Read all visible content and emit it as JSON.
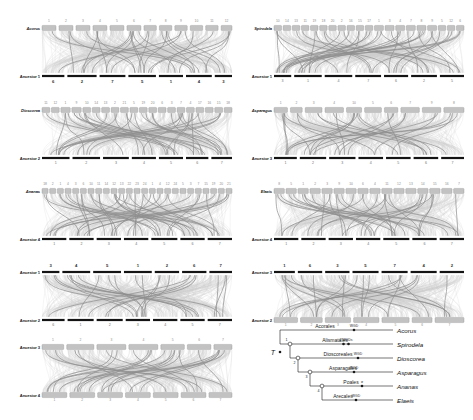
{
  "figure": {
    "type": "comparative-genomics-synteny-figure",
    "background": "#ffffff",
    "accent_dark": "#1a1a1a",
    "accent_block": "#b9b9b9",
    "ribbon_light": "#d8d8d8",
    "ribbon_mid": "#9a9a9a"
  },
  "panels": [
    {
      "id": "panel-acorus",
      "x": 8,
      "y": 14,
      "w": 228,
      "h": 78,
      "top": {
        "label": "Acorus",
        "italic": true,
        "style": "block",
        "chromosomes": [
          {
            "label": "1",
            "span": 9
          },
          {
            "label": "2",
            "span": 9
          },
          {
            "label": "3",
            "span": 9
          },
          {
            "label": "4",
            "span": 9
          },
          {
            "label": "5",
            "span": 9
          },
          {
            "label": "6",
            "span": 9
          },
          {
            "label": "7",
            "span": 8
          },
          {
            "label": "8",
            "span": 8
          },
          {
            "label": "9",
            "span": 8
          },
          {
            "label": "10",
            "span": 8
          },
          {
            "label": "11",
            "span": 8
          },
          {
            "label": "12",
            "span": 7
          }
        ]
      },
      "bottom": {
        "label": "Ancestor 1",
        "italic": false,
        "style": "bar",
        "chromosomes": [
          {
            "label": "6",
            "span": 13
          },
          {
            "label": "2",
            "span": 17
          },
          {
            "label": "7",
            "span": 15
          },
          {
            "label": "5",
            "span": 16
          },
          {
            "label": "1",
            "span": 14
          },
          {
            "label": "4",
            "span": 15
          },
          {
            "label": "3",
            "span": 10
          }
        ]
      }
    },
    {
      "id": "panel-spirodela",
      "x": 240,
      "y": 14,
      "w": 228,
      "h": 78,
      "top": {
        "label": "Spirodela",
        "italic": true,
        "style": "block",
        "chromosomes": [
          {
            "label": "10",
            "span": 5
          },
          {
            "label": "14",
            "span": 5
          },
          {
            "label": "13",
            "span": 5
          },
          {
            "label": "11",
            "span": 5
          },
          {
            "label": "19",
            "span": 5
          },
          {
            "label": "18",
            "span": 5
          },
          {
            "label": "20",
            "span": 5
          },
          {
            "label": "2",
            "span": 5
          },
          {
            "label": "16",
            "span": 5
          },
          {
            "label": "15",
            "span": 5
          },
          {
            "label": "17",
            "span": 5
          },
          {
            "label": "1",
            "span": 6
          },
          {
            "label": "3",
            "span": 6
          },
          {
            "label": "4",
            "span": 6
          },
          {
            "label": "7",
            "span": 6
          },
          {
            "label": "8",
            "span": 6
          },
          {
            "label": "9",
            "span": 6
          },
          {
            "label": "5",
            "span": 5
          },
          {
            "label": "12",
            "span": 5
          },
          {
            "label": "6",
            "span": 5
          }
        ]
      },
      "bottom": {
        "label": "Ancestor 1",
        "italic": false,
        "style": "bar",
        "chromosomes": [
          {
            "label": "3",
            "span": 10
          },
          {
            "label": "1",
            "span": 16
          },
          {
            "label": "4",
            "span": 16
          },
          {
            "label": "7",
            "span": 15
          },
          {
            "label": "6",
            "span": 14
          },
          {
            "label": "2",
            "span": 15
          },
          {
            "label": "5",
            "span": 14
          }
        ]
      }
    },
    {
      "id": "panel-dioscorea",
      "x": 8,
      "y": 96,
      "w": 228,
      "h": 78,
      "top": {
        "label": "Dioscorea",
        "italic": true,
        "style": "block",
        "chromosomes": [
          {
            "label": "11",
            "span": 5
          },
          {
            "label": "12",
            "span": 5
          },
          {
            "label": "1",
            "span": 6
          },
          {
            "label": "9",
            "span": 6
          },
          {
            "label": "10",
            "span": 5
          },
          {
            "label": "14",
            "span": 5
          },
          {
            "label": "13",
            "span": 5
          },
          {
            "label": "2",
            "span": 5
          },
          {
            "label": "21",
            "span": 5
          },
          {
            "label": "5",
            "span": 5
          },
          {
            "label": "19",
            "span": 5
          },
          {
            "label": "20",
            "span": 5
          },
          {
            "label": "6",
            "span": 5
          },
          {
            "label": "3",
            "span": 5
          },
          {
            "label": "7",
            "span": 5
          },
          {
            "label": "4",
            "span": 5
          },
          {
            "label": "17",
            "span": 5
          },
          {
            "label": "16",
            "span": 5
          },
          {
            "label": "15",
            "span": 5
          },
          {
            "label": "18",
            "span": 5
          }
        ]
      },
      "bottom": {
        "label": "Ancestor 2",
        "italic": false,
        "style": "bar",
        "chromosomes": [
          {
            "label": "1",
            "span": 16
          },
          {
            "label": "2",
            "span": 16
          },
          {
            "label": "3",
            "span": 15
          },
          {
            "label": "4",
            "span": 14
          },
          {
            "label": "5",
            "span": 14
          },
          {
            "label": "6",
            "span": 13
          },
          {
            "label": "7",
            "span": 12
          }
        ]
      }
    },
    {
      "id": "panel-asparagus",
      "x": 240,
      "y": 96,
      "w": 228,
      "h": 78,
      "top": {
        "label": "Asparagus",
        "italic": true,
        "style": "block",
        "chromosomes": [
          {
            "label": "1",
            "span": 8
          },
          {
            "label": "2",
            "span": 7
          },
          {
            "label": "3",
            "span": 10
          },
          {
            "label": "4",
            "span": 11
          },
          {
            "label": "10",
            "span": 9
          },
          {
            "label": "5",
            "span": 10
          },
          {
            "label": "6",
            "span": 8
          },
          {
            "label": "7",
            "span": 11
          },
          {
            "label": "9",
            "span": 11
          },
          {
            "label": "8",
            "span": 12
          }
        ]
      },
      "bottom": {
        "label": "Ancestor 3",
        "italic": false,
        "style": "bar",
        "chromosomes": [
          {
            "label": "1",
            "span": 13
          },
          {
            "label": "2",
            "span": 15
          },
          {
            "label": "3",
            "span": 15
          },
          {
            "label": "4",
            "span": 14
          },
          {
            "label": "5",
            "span": 14
          },
          {
            "label": "6",
            "span": 14
          },
          {
            "label": "7",
            "span": 13
          }
        ]
      }
    },
    {
      "id": "panel-ananas",
      "x": 8,
      "y": 177,
      "w": 228,
      "h": 78,
      "top": {
        "label": "Ananas",
        "italic": true,
        "style": "block",
        "chromosomes": [
          {
            "label": "18",
            "span": 4
          },
          {
            "label": "2",
            "span": 4
          },
          {
            "label": "1",
            "span": 4
          },
          {
            "label": "4",
            "span": 4
          },
          {
            "label": "3",
            "span": 4
          },
          {
            "label": "6",
            "span": 4
          },
          {
            "label": "10",
            "span": 4
          },
          {
            "label": "11",
            "span": 4
          },
          {
            "label": "14",
            "span": 4
          },
          {
            "label": "12",
            "span": 4
          },
          {
            "label": "13",
            "span": 4
          },
          {
            "label": "22",
            "span": 4
          },
          {
            "label": "23",
            "span": 4
          },
          {
            "label": "24",
            "span": 4
          },
          {
            "label": "1",
            "span": 4
          },
          {
            "label": "4",
            "span": 4
          },
          {
            "label": "12",
            "span": 4
          },
          {
            "label": "24",
            "span": 4
          },
          {
            "label": "5",
            "span": 4
          },
          {
            "label": "3",
            "span": 4
          },
          {
            "label": "7",
            "span": 4
          },
          {
            "label": "15",
            "span": 4
          },
          {
            "label": "19",
            "span": 4
          },
          {
            "label": "20",
            "span": 4
          },
          {
            "label": "21",
            "span": 4
          }
        ]
      },
      "bottom": {
        "label": "Ancestor 4",
        "italic": false,
        "style": "bar",
        "chromosomes": [
          {
            "label": "1",
            "span": 14
          },
          {
            "label": "2",
            "span": 14
          },
          {
            "label": "3",
            "span": 14
          },
          {
            "label": "4",
            "span": 14
          },
          {
            "label": "5",
            "span": 15
          },
          {
            "label": "6",
            "span": 14
          },
          {
            "label": "7",
            "span": 14
          }
        ]
      }
    },
    {
      "id": "panel-elaeis",
      "x": 240,
      "y": 177,
      "w": 228,
      "h": 78,
      "top": {
        "label": "Elaeis",
        "italic": true,
        "style": "block",
        "chromosomes": [
          {
            "label": "8",
            "span": 6
          },
          {
            "label": "5",
            "span": 6
          },
          {
            "label": "1",
            "span": 6
          },
          {
            "label": "2",
            "span": 6
          },
          {
            "label": "3",
            "span": 6
          },
          {
            "label": "9",
            "span": 6
          },
          {
            "label": "10",
            "span": 6
          },
          {
            "label": "6",
            "span": 6
          },
          {
            "label": "4",
            "span": 6
          },
          {
            "label": "11",
            "span": 6
          },
          {
            "label": "12",
            "span": 6
          },
          {
            "label": "13",
            "span": 6
          },
          {
            "label": "14",
            "span": 6
          },
          {
            "label": "15",
            "span": 6
          },
          {
            "label": "16",
            "span": 6
          },
          {
            "label": "7",
            "span": 6
          }
        ]
      },
      "bottom": {
        "label": "Ancestor 4",
        "italic": false,
        "style": "bar",
        "chromosomes": [
          {
            "label": "1",
            "span": 14
          },
          {
            "label": "2",
            "span": 14
          },
          {
            "label": "3",
            "span": 14
          },
          {
            "label": "4",
            "span": 14
          },
          {
            "label": "5",
            "span": 15
          },
          {
            "label": "6",
            "span": 14
          },
          {
            "label": "7",
            "span": 14
          }
        ]
      }
    },
    {
      "id": "panel-anc1-anc2",
      "x": 8,
      "y": 258,
      "w": 228,
      "h": 78,
      "top": {
        "label": "Ancestor 1",
        "italic": false,
        "style": "bar",
        "chromosomes": [
          {
            "label": "3",
            "span": 10
          },
          {
            "label": "4",
            "span": 16
          },
          {
            "label": "5",
            "span": 16
          },
          {
            "label": "1",
            "span": 16
          },
          {
            "label": "2",
            "span": 14
          },
          {
            "label": "6",
            "span": 14
          },
          {
            "label": "7",
            "span": 13
          }
        ]
      },
      "bottom": {
        "label": "Ancestor 2",
        "italic": false,
        "style": "bar",
        "chromosomes": [
          {
            "label": "6",
            "span": 13
          },
          {
            "label": "1",
            "span": 15
          },
          {
            "label": "2",
            "span": 15
          },
          {
            "label": "3",
            "span": 14
          },
          {
            "label": "4",
            "span": 14
          },
          {
            "label": "5",
            "span": 14
          },
          {
            "label": "7",
            "span": 14
          }
        ]
      }
    },
    {
      "id": "panel-anc3-anc2",
      "x": 240,
      "y": 258,
      "w": 228,
      "h": 78,
      "top": {
        "label": "Ancestor 3",
        "italic": false,
        "style": "bar",
        "chromosomes": [
          {
            "label": "1",
            "span": 12
          },
          {
            "label": "6",
            "span": 14
          },
          {
            "label": "3",
            "span": 14
          },
          {
            "label": "5",
            "span": 15
          },
          {
            "label": "7",
            "span": 15
          },
          {
            "label": "4",
            "span": 15
          },
          {
            "label": "2",
            "span": 14
          }
        ]
      },
      "bottom": {
        "label": "Ancestor 2",
        "italic": false,
        "style": "block",
        "chromosomes": [
          {
            "label": "1",
            "span": 13
          },
          {
            "label": "2",
            "span": 12
          },
          {
            "label": "3",
            "span": 14
          },
          {
            "label": "4",
            "span": 14
          },
          {
            "label": "5",
            "span": 15
          },
          {
            "label": "6",
            "span": 11
          },
          {
            "label": "7",
            "span": 16
          }
        ]
      }
    },
    {
      "id": "panel-anc3-anc4",
      "x": 8,
      "y": 333,
      "w": 228,
      "h": 78,
      "top": {
        "label": "Ancestor 3",
        "italic": false,
        "style": "block",
        "chromosomes": [
          {
            "label": "1",
            "span": 12
          },
          {
            "label": "2",
            "span": 15
          },
          {
            "label": "3",
            "span": 16
          },
          {
            "label": "4",
            "span": 16
          },
          {
            "label": "5",
            "span": 13
          },
          {
            "label": "6",
            "span": 13
          },
          {
            "label": "7",
            "span": 10
          }
        ]
      },
      "bottom": {
        "label": "Ancestor 4",
        "italic": false,
        "style": "block",
        "chromosomes": [
          {
            "label": "1",
            "span": 14
          },
          {
            "label": "2",
            "span": 14
          },
          {
            "label": "3",
            "span": 14
          },
          {
            "label": "4",
            "span": 14
          },
          {
            "label": "5",
            "span": 14
          },
          {
            "label": "6",
            "span": 14
          },
          {
            "label": "7",
            "span": 13
          }
        ]
      }
    }
  ],
  "tree": {
    "root_symbol": "T",
    "tips": [
      {
        "name": "Acorus",
        "order": "Acorales",
        "wgd": "WGD",
        "wgd_count": 1
      },
      {
        "name": "Spirodela",
        "order": "Alismatales",
        "wgd": "2 WGDs",
        "wgd_count": 2
      },
      {
        "name": "Dioscorea",
        "order": "Dioscoreales",
        "wgd": "WGD",
        "wgd_count": 1
      },
      {
        "name": "Asparagus",
        "order": "Asparagales",
        "wgd": "WGD",
        "wgd_count": 1
      },
      {
        "name": "Ananas",
        "order": "Poales",
        "wgd": "σ",
        "wgd_count": 1
      },
      {
        "name": "Elaeis",
        "order": "Arecales",
        "wgd": "WGD",
        "wgd_count": 1
      }
    ],
    "nodes": [
      {
        "id": "1",
        "label": "1"
      },
      {
        "id": "2",
        "label": "2"
      },
      {
        "id": "3",
        "label": "3"
      },
      {
        "id": "4",
        "label": "4"
      }
    ]
  }
}
